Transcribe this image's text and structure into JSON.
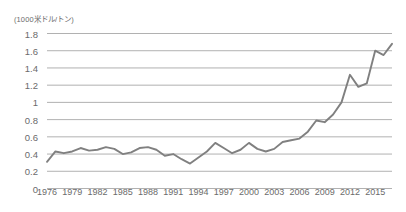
{
  "chart_data": {
    "type": "line",
    "title": "(1000米ドル/トン)",
    "subtitle": "",
    "xlabel": "",
    "ylabel": "",
    "ylim": [
      0,
      1.8
    ],
    "xlim": [
      1976,
      2017
    ],
    "ytick_labels": [
      "1.8",
      "1.6",
      "1.4",
      "1.2",
      "1",
      "0.8",
      "0.6",
      "0.4",
      "0.2",
      "0"
    ],
    "ytick_values": [
      1.8,
      1.6,
      1.4,
      1.2,
      1.0,
      0.8,
      0.6,
      0.4,
      0.2,
      0
    ],
    "xtick_labels": [
      "1976",
      "1979",
      "1982",
      "1985",
      "1988",
      "1991",
      "1994",
      "1997",
      "2000",
      "2003",
      "2006",
      "2009",
      "2012",
      "2015"
    ],
    "xtick_values": [
      1976,
      1979,
      1982,
      1985,
      1988,
      1991,
      1994,
      1997,
      2000,
      2003,
      2006,
      2009,
      2012,
      2015
    ],
    "grid": true,
    "grid_axis": "y",
    "legend": false,
    "legend_position": "none",
    "line_color": "#808080",
    "grid_color": "#a8a8a8",
    "text_color": "#6b6b6b",
    "background_color": "#ffffff",
    "x": [
      1976,
      1977,
      1978,
      1979,
      1980,
      1981,
      1982,
      1983,
      1984,
      1985,
      1986,
      1987,
      1988,
      1989,
      1990,
      1991,
      1992,
      1993,
      1994,
      1995,
      1996,
      1997,
      1998,
      1999,
      2000,
      2001,
      2002,
      2003,
      2004,
      2005,
      2006,
      2007,
      2008,
      2009,
      2010,
      2011,
      2012,
      2013,
      2014,
      2015,
      2016,
      2017
    ],
    "values": [
      0.31,
      0.43,
      0.41,
      0.43,
      0.47,
      0.44,
      0.45,
      0.48,
      0.46,
      0.4,
      0.42,
      0.47,
      0.48,
      0.45,
      0.38,
      0.4,
      0.34,
      0.29,
      0.36,
      0.43,
      0.53,
      0.47,
      0.41,
      0.45,
      0.53,
      0.46,
      0.43,
      0.46,
      0.54,
      0.56,
      0.58,
      0.66,
      0.79,
      0.77,
      0.86,
      1.0,
      1.32,
      1.18,
      1.22,
      1.6,
      1.55,
      1.68
    ],
    "series": [
      {
        "name": "price",
        "values": [
          0.31,
          0.43,
          0.41,
          0.43,
          0.47,
          0.44,
          0.45,
          0.48,
          0.46,
          0.4,
          0.42,
          0.47,
          0.48,
          0.45,
          0.38,
          0.4,
          0.34,
          0.29,
          0.36,
          0.43,
          0.53,
          0.47,
          0.41,
          0.45,
          0.53,
          0.46,
          0.43,
          0.46,
          0.54,
          0.56,
          0.58,
          0.66,
          0.79,
          0.77,
          0.86,
          1.0,
          1.32,
          1.18,
          1.22,
          1.6,
          1.55,
          1.68
        ]
      }
    ],
    "annotations": []
  }
}
